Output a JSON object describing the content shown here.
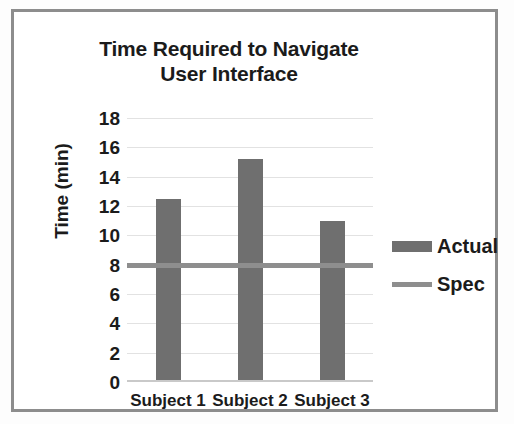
{
  "chart_data": {
    "type": "bar",
    "title": "Time Required to Navigate User Interface",
    "title_lines": [
      "Time Required to Navigate",
      "User Interface"
    ],
    "xlabel": "",
    "ylabel": "Time (min)",
    "categories": [
      "Subject 1",
      "Subject 2",
      "Subject 3"
    ],
    "series": [
      {
        "name": "Actual",
        "type": "bar",
        "values": [
          12.5,
          15.2,
          11.0
        ],
        "color": "#6f6f6f"
      },
      {
        "name": "Spec",
        "type": "line",
        "value": 8,
        "values": [
          8,
          8,
          8
        ],
        "color": "#8e8e8e"
      }
    ],
    "ylim": [
      0,
      18
    ],
    "ytick_labels": [
      "18",
      "16",
      "14",
      "12",
      "10",
      "8",
      "6",
      "4",
      "2",
      "0"
    ],
    "ytick_values": [
      18,
      16,
      14,
      12,
      10,
      8,
      6,
      4,
      2,
      0
    ],
    "ytick_step": 2,
    "grid": true,
    "grid_axis": "y",
    "legend_position": "right",
    "legend": [
      {
        "label": "Actual",
        "marker": "bar-swatch",
        "color": "#6f6f6f"
      },
      {
        "label": "Spec",
        "marker": "line-swatch",
        "color": "#8e8e8e"
      }
    ]
  },
  "figure": {
    "border_color": "#8d8d8d",
    "background": "#ffffff"
  }
}
